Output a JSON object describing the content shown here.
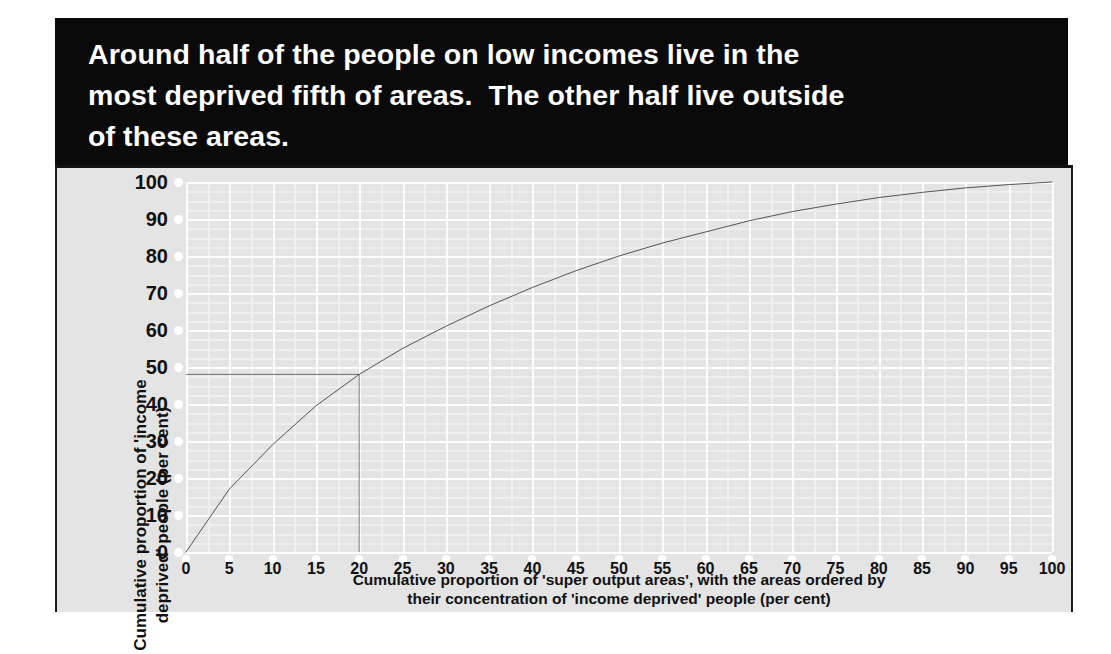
{
  "title": {
    "lines": [
      "Around half of the people on low incomes live in the",
      "most deprived fifth of areas.  The other half live outside",
      "of these areas."
    ],
    "background": "#0a0a0a",
    "color": "#ffffff"
  },
  "chart_data": {
    "type": "line",
    "title": "Around half of the people on low incomes live in the most deprived fifth of areas.  The other half live outside of these areas.",
    "xlabel_lines": [
      "Cumulative proportion of 'super output areas', with the areas ordered by",
      "their concentration of 'income deprived' people (per cent)"
    ],
    "ylabel_lines": [
      "Cumulative proportion of 'income",
      "deprived' people (per cent)"
    ],
    "xlim": [
      0,
      100
    ],
    "ylim": [
      0,
      100
    ],
    "xticks": [
      0,
      5,
      10,
      15,
      20,
      25,
      30,
      35,
      40,
      45,
      50,
      55,
      60,
      65,
      70,
      75,
      80,
      85,
      90,
      95,
      100
    ],
    "yticks": [
      0,
      10,
      20,
      30,
      40,
      50,
      60,
      70,
      80,
      90,
      100
    ],
    "grid": true,
    "legend": false,
    "plot_background": "#e4e4e4",
    "gridline_color": "#fdfdfd",
    "series": [
      {
        "name": "Cumulative income deprived people",
        "color": "#3a3a3a",
        "x": [
          0,
          5,
          10,
          15,
          20,
          25,
          30,
          35,
          40,
          45,
          50,
          55,
          60,
          65,
          70,
          75,
          80,
          85,
          90,
          95,
          100
        ],
        "values": [
          0,
          17,
          29,
          39.5,
          48,
          55,
          61,
          66.5,
          71.5,
          76,
          80,
          83.5,
          86.5,
          89.5,
          92,
          94,
          95.8,
          97.2,
          98.4,
          99.3,
          100
        ]
      }
    ],
    "annotations": [
      {
        "name": "reference-lines",
        "description": "Horizontal and vertical guide lines meeting at the curve",
        "x": 20,
        "y": 48,
        "color": "#111111"
      }
    ]
  }
}
